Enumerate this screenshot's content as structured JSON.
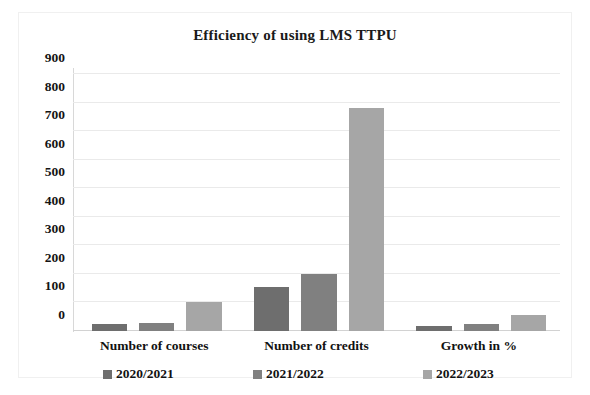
{
  "chart_data": {
    "type": "bar",
    "title": "Efficiency of using LMS TTPU",
    "xlabel": "",
    "ylabel": "",
    "ylim": [
      0,
      900
    ],
    "ytick_step": 100,
    "yticks": [
      900,
      800,
      700,
      600,
      500,
      400,
      300,
      200,
      100,
      0
    ],
    "grid": true,
    "legend_position": "bottom",
    "categories": [
      "Number of courses",
      "Number of credits",
      "Growth in %"
    ],
    "series": [
      {
        "name": "2020/2021",
        "color": "#6e6e6e",
        "values": [
          25,
          155,
          18
        ]
      },
      {
        "name": "2021/2022",
        "color": "#808080",
        "values": [
          27,
          200,
          23
        ]
      },
      {
        "name": "2022/2023",
        "color": "#a6a6a6",
        "values": [
          101,
          780,
          56
        ]
      }
    ]
  }
}
